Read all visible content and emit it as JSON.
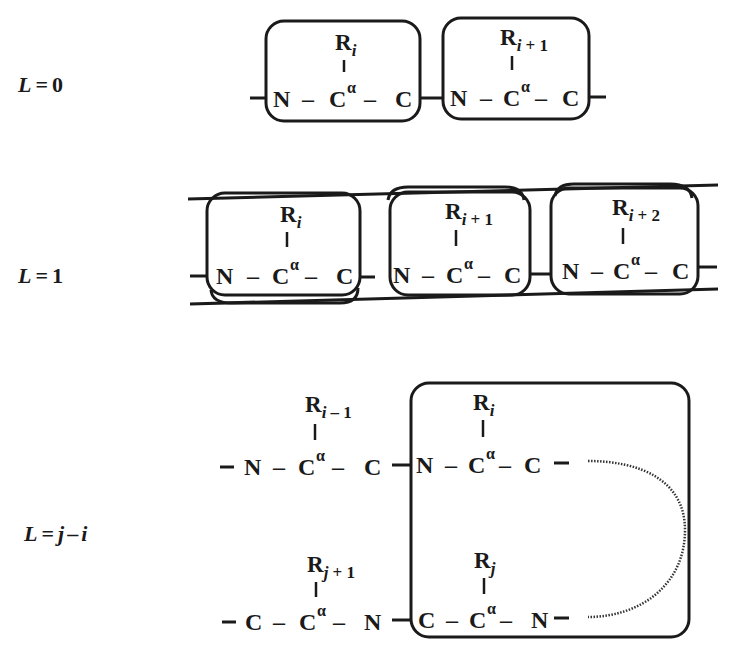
{
  "rows": [
    {
      "label": {
        "L": "L",
        "eq": "=",
        "val": "0"
      },
      "residues": [
        {
          "r": "R",
          "sub": "i",
          "subn": "",
          "n": "N",
          "ca": "C",
          "alpha": "α",
          "c": "C"
        },
        {
          "r": "R",
          "sub": "i",
          "subn": " + 1",
          "n": "N",
          "ca": "C",
          "alpha": "α",
          "c": "C"
        }
      ]
    },
    {
      "label": {
        "L": "L",
        "eq": "=",
        "val": "1"
      },
      "residues": [
        {
          "r": "R",
          "sub": "i",
          "subn": "",
          "n": "N",
          "ca": "C",
          "alpha": "α",
          "c": "C"
        },
        {
          "r": "R",
          "sub": "i",
          "subn": " + 1",
          "n": "N",
          "ca": "C",
          "alpha": "α",
          "c": "C"
        },
        {
          "r": "R",
          "sub": "i",
          "subn": " + 2",
          "n": "N",
          "ca": "C",
          "alpha": "α",
          "c": "C"
        }
      ]
    },
    {
      "label": {
        "L": "L",
        "eq": "=",
        "j": "j",
        "minus": "–",
        "i": "i"
      },
      "top_chain": [
        {
          "r": "R",
          "sub": "i",
          "subn": " – 1",
          "n": "N",
          "ca": "C",
          "alpha": "α",
          "c": "C"
        },
        {
          "r": "R",
          "sub": "i",
          "subn": "",
          "n": "N",
          "ca": "C",
          "alpha": "α",
          "c": "C"
        }
      ],
      "bottom_chain": [
        {
          "r": "R",
          "sub": "j",
          "subn": " + 1",
          "c": "C",
          "ca": "C",
          "alpha": "α",
          "n": "N"
        },
        {
          "r": "R",
          "sub": "j",
          "subn": "",
          "c": "C",
          "ca": "C",
          "alpha": "α",
          "n": "N"
        }
      ]
    }
  ],
  "dash": "–"
}
